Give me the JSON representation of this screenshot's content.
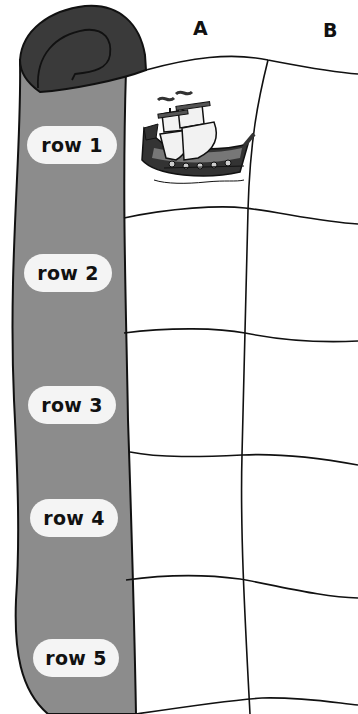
{
  "board": {
    "columns": [
      {
        "label": "A"
      },
      {
        "label": "B"
      }
    ],
    "rows": [
      {
        "label": "row 1"
      },
      {
        "label": "row 2"
      },
      {
        "label": "row 3"
      },
      {
        "label": "row 4"
      },
      {
        "label": "row 5"
      }
    ],
    "pieces": [
      {
        "type": "ship-icon",
        "row": "row 1",
        "column": "A"
      }
    ]
  },
  "colors": {
    "scroll_body": "#8c8c8c",
    "scroll_roll": "#3a3a3a",
    "pill_bg": "#f4f4f4",
    "grid_line": "#111111",
    "paper": "#ffffff"
  }
}
